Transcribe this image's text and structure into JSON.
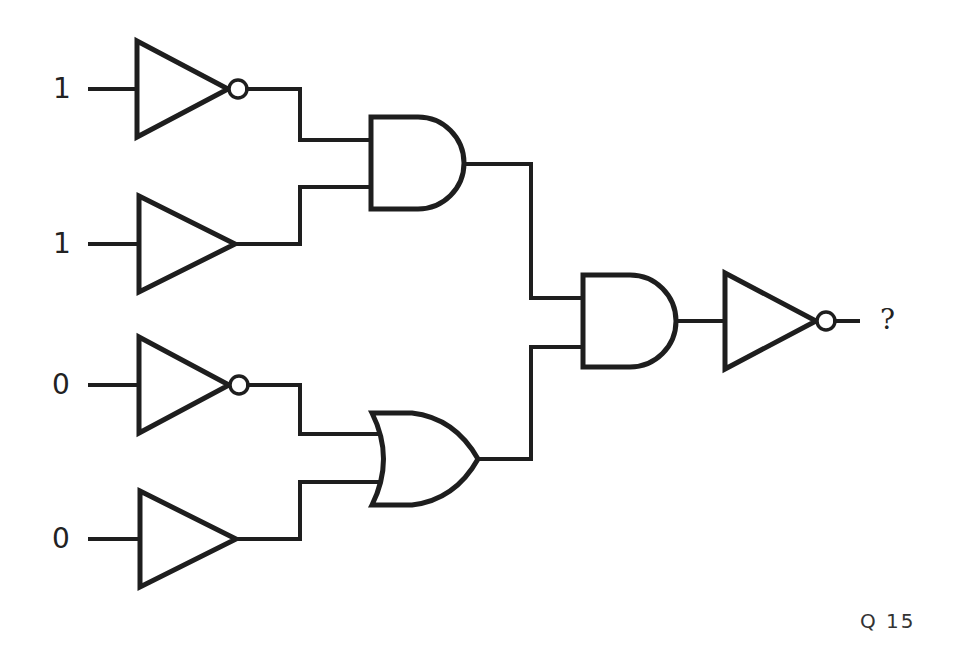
{
  "diagram": {
    "type": "logic-circuit",
    "inputs": [
      {
        "id": "in1",
        "value": "1",
        "gate": "NOT"
      },
      {
        "id": "in2",
        "value": "1",
        "gate": "BUFFER"
      },
      {
        "id": "in3",
        "value": "0",
        "gate": "NOT"
      },
      {
        "id": "in4",
        "value": "0",
        "gate": "BUFFER"
      }
    ],
    "gates": [
      {
        "id": "not1",
        "type": "NOT",
        "input": "in1"
      },
      {
        "id": "buf2",
        "type": "BUFFER",
        "input": "in2"
      },
      {
        "id": "not3",
        "type": "NOT",
        "input": "in3"
      },
      {
        "id": "buf4",
        "type": "BUFFER",
        "input": "in4"
      },
      {
        "id": "and1",
        "type": "AND",
        "inputs": [
          "not1",
          "buf2"
        ]
      },
      {
        "id": "or1",
        "type": "OR",
        "inputs": [
          "not3",
          "buf4"
        ]
      },
      {
        "id": "and2",
        "type": "AND",
        "inputs": [
          "and1",
          "or1"
        ]
      },
      {
        "id": "not_out",
        "type": "NOT",
        "input": "and2"
      }
    ],
    "output": {
      "label": "?"
    },
    "question_label": "Q 15"
  },
  "colors": {
    "stroke": "#1e1e1e",
    "background": "#ffffff"
  }
}
